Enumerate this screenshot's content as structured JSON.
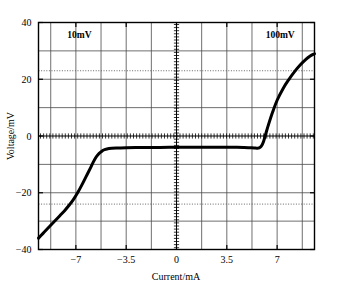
{
  "chart_data": {
    "type": "line",
    "title": "",
    "xlabel": "Current/mA",
    "ylabel": "Voltage/mV",
    "xlim": [
      -9.6,
      9.6
    ],
    "ylim": [
      -40,
      40
    ],
    "xticks": [
      -7,
      -3.5,
      0,
      3.5,
      7
    ],
    "xticklabels": [
      "−7",
      "−3.5",
      "0",
      "3.5",
      "7"
    ],
    "yticks": [
      -40,
      -20,
      0,
      20,
      40
    ],
    "yticklabels": [
      "−40",
      "−20",
      "0",
      "20",
      "40"
    ],
    "grid": true,
    "grid_x_step": 1.75,
    "grid_y_step": 10,
    "legend": "none",
    "annotations": [
      {
        "text": "10mV",
        "x": -7.6,
        "y": 34.5,
        "align": "left"
      },
      {
        "text": "100mV",
        "x": 6.2,
        "y": 34.5,
        "align": "left"
      }
    ],
    "reference_lines": [
      {
        "orientation": "horizontal",
        "value": 23,
        "style": "dotted"
      },
      {
        "orientation": "horizontal",
        "value": -24,
        "style": "dotted"
      },
      {
        "orientation": "horizontal",
        "value": 0,
        "style": "axis-ticked"
      },
      {
        "orientation": "vertical",
        "value": 0,
        "style": "axis-ticked"
      }
    ],
    "series": [
      {
        "name": "I-V characteristic",
        "color": "#000000",
        "linewidth": 3,
        "x": [
          -9.6,
          -9.3,
          -9.0,
          -8.7,
          -8.4,
          -8.1,
          -7.8,
          -7.5,
          -7.2,
          -6.9,
          -6.6,
          -6.3,
          -6.0,
          -5.8,
          -5.6,
          -5.45,
          -5.3,
          -5.15,
          -5.0,
          -4.7,
          -4.2,
          -3.5,
          -2.5,
          -1.5,
          -0.5,
          0,
          0.5,
          1.5,
          2.5,
          3.5,
          4.2,
          4.7,
          5.0,
          5.2,
          5.4,
          5.6,
          5.75,
          5.9,
          6.05,
          6.2,
          6.4,
          6.7,
          7.0,
          7.4,
          7.8,
          8.2,
          8.6,
          9.0,
          9.3,
          9.6
        ],
        "y": [
          -36.0,
          -34.4,
          -32.8,
          -31.2,
          -29.6,
          -28.0,
          -26.4,
          -24.6,
          -22.6,
          -20.2,
          -17.4,
          -14.4,
          -11.4,
          -9.3,
          -7.5,
          -6.5,
          -5.8,
          -5.2,
          -4.8,
          -4.4,
          -4.2,
          -4.1,
          -4.05,
          -4.05,
          -4.0,
          -4.0,
          -4.0,
          -4.0,
          -4.0,
          -4.0,
          -4.0,
          -4.05,
          -4.1,
          -4.15,
          -4.2,
          -4.3,
          -4.2,
          -3.6,
          -2.0,
          0.6,
          4.0,
          8.6,
          12.6,
          16.6,
          19.8,
          22.6,
          25.0,
          27.0,
          28.2,
          29.0
        ]
      }
    ]
  },
  "axis_labels": {
    "x_title": "Current/mA",
    "y_title": "Voltage/mV"
  }
}
